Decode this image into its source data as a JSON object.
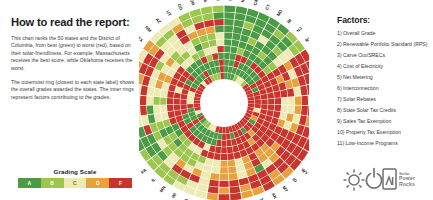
{
  "howto": {
    "title": "How to read the report:",
    "paragraphs": [
      "This chart ranks the 50 states and the District of Columbia, from best (green) to worst (red), based on their solar-friendliness. For example, Massachusetts receives the best score, while Oklahoma receives the worst.",
      "The outermost ring (closest to each state label) shows the overall grades awarded the states. The inner rings represent factors contributing to the grades."
    ]
  },
  "grading_scale": {
    "title": "Grading Scale",
    "grades": [
      {
        "label": "A",
        "color": "#4a9b43"
      },
      {
        "label": "B",
        "color": "#9cc64c"
      },
      {
        "label": "C",
        "color": "#eeeab3"
      },
      {
        "label": "D",
        "color": "#e8a13c"
      },
      {
        "label": "F",
        "color": "#c9352c"
      }
    ]
  },
  "factors": {
    "title": "Factors:",
    "items": [
      "1) Overall Grade",
      "2) Renewable Portfolio Standard (RPS)",
      "3) Carve Out/SRECs",
      "4) Cost of Electricity",
      "5) Net Metering",
      "6) Interconnection",
      "7) Solar Rebates",
      "8) State Solar Tax Credits",
      "9) Sales Tax Exemption",
      "10) Property Tax Exemption",
      "11) Low-Income Programs"
    ]
  },
  "logo": {
    "icons": [
      "sun-icon",
      "power-icon",
      "rock-icon"
    ],
    "word_1": "Solar",
    "word_2": "Power",
    "word_3": "Rocks",
    "color": "#7d7d7d"
  },
  "chart_data": {
    "type": "heatmap",
    "layout": "radial",
    "grid": false,
    "legend": "grading-scale",
    "ring_count": 11,
    "ring_labels": [
      "Overall Grade",
      "Renewable Portfolio Standard (RPS)",
      "Carve Out/SRECs",
      "Cost of Electricity",
      "Net Metering",
      "Interconnection",
      "Solar Rebates",
      "State Solar Tax Credits",
      "Sales Tax Exemption",
      "Property Tax Exemption",
      "Low-Income Programs"
    ],
    "grade_colors": {
      "A": "#4a9b43",
      "B": "#9cc64c",
      "C": "#eeeab3",
      "D": "#e8a13c",
      "F": "#c9352c"
    },
    "categories": [
      "MA",
      "NY",
      "CA",
      "CT",
      "MD",
      "RI",
      "NJ",
      "NV",
      "OK",
      "LA",
      "AL",
      "MS",
      "MO",
      "TN",
      "MI",
      "KY",
      "ND",
      "SD",
      "WY",
      "ID",
      "MT",
      "AK",
      "NE",
      "KS",
      "AR",
      "WV",
      "IN",
      "OH",
      "IA",
      "WI",
      "MN",
      "IL",
      "PA",
      "DE",
      "DC",
      "VT",
      "NH",
      "ME",
      "VA",
      "NC",
      "SC",
      "GA",
      "FL",
      "TX",
      "NM",
      "AZ",
      "UT",
      "CO",
      "OR",
      "WA",
      "HI"
    ],
    "series": [
      {
        "name": "Overall Grade",
        "values": [
          "A",
          "A",
          "A",
          "A",
          "A",
          "A",
          "B",
          "B",
          "F",
          "F",
          "F",
          "F",
          "D",
          "D",
          "D",
          "D",
          "F",
          "F",
          "F",
          "D",
          "D",
          "F",
          "D",
          "D",
          "F",
          "F",
          "D",
          "C",
          "C",
          "C",
          "B",
          "B",
          "B",
          "B",
          "A",
          "B",
          "C",
          "C",
          "C",
          "C",
          "D",
          "D",
          "C",
          "D",
          "C",
          "C",
          "C",
          "B",
          "B",
          "B",
          "B"
        ]
      },
      {
        "name": "Renewable Portfolio Standard (RPS)",
        "values": [
          "A",
          "A",
          "A",
          "A",
          "A",
          "B",
          "A",
          "B",
          "F",
          "F",
          "F",
          "F",
          "C",
          "F",
          "D",
          "F",
          "F",
          "F",
          "F",
          "F",
          "D",
          "F",
          "F",
          "D",
          "F",
          "D",
          "F",
          "C",
          "C",
          "B",
          "B",
          "B",
          "B",
          "A",
          "A",
          "A",
          "C",
          "C",
          "C",
          "C",
          "D",
          "F",
          "F",
          "D",
          "B",
          "B",
          "D",
          "B",
          "B",
          "B",
          "A"
        ]
      },
      {
        "name": "Carve Out/SRECs",
        "values": [
          "A",
          "A",
          "B",
          "A",
          "A",
          "A",
          "A",
          "C",
          "F",
          "F",
          "F",
          "F",
          "F",
          "F",
          "F",
          "F",
          "F",
          "F",
          "F",
          "F",
          "F",
          "F",
          "F",
          "F",
          "F",
          "F",
          "F",
          "C",
          "F",
          "F",
          "F",
          "C",
          "A",
          "A",
          "A",
          "F",
          "C",
          "F",
          "F",
          "F",
          "F",
          "F",
          "F",
          "F",
          "C",
          "C",
          "F",
          "C",
          "F",
          "F",
          "F"
        ]
      },
      {
        "name": "Cost of Electricity",
        "values": [
          "A",
          "A",
          "A",
          "A",
          "C",
          "A",
          "B",
          "C",
          "D",
          "C",
          "D",
          "C",
          "D",
          "D",
          "C",
          "D",
          "F",
          "F",
          "F",
          "D",
          "C",
          "A",
          "D",
          "C",
          "D",
          "D",
          "D",
          "C",
          "D",
          "C",
          "D",
          "C",
          "B",
          "C",
          "B",
          "B",
          "A",
          "A",
          "C",
          "C",
          "C",
          "C",
          "B",
          "C",
          "C",
          "C",
          "F",
          "D",
          "D",
          "D",
          "A"
        ]
      },
      {
        "name": "Net Metering",
        "values": [
          "A",
          "A",
          "A",
          "B",
          "A",
          "A",
          "A",
          "C",
          "F",
          "F",
          "D",
          "F",
          "C",
          "C",
          "D",
          "C",
          "F",
          "F",
          "D",
          "D",
          "D",
          "F",
          "D",
          "C",
          "D",
          "D",
          "C",
          "C",
          "C",
          "B",
          "B",
          "B",
          "B",
          "B",
          "A",
          "B",
          "C",
          "C",
          "B",
          "C",
          "D",
          "D",
          "C",
          "D",
          "B",
          "C",
          "C",
          "B",
          "B",
          "B",
          "C"
        ]
      },
      {
        "name": "Interconnection",
        "values": [
          "A",
          "A",
          "A",
          "A",
          "A",
          "B",
          "A",
          "B",
          "F",
          "D",
          "F",
          "F",
          "C",
          "C",
          "C",
          "D",
          "F",
          "F",
          "F",
          "D",
          "D",
          "F",
          "D",
          "C",
          "D",
          "D",
          "C",
          "C",
          "B",
          "B",
          "B",
          "B",
          "A",
          "B",
          "A",
          "B",
          "C",
          "C",
          "B",
          "C",
          "C",
          "D",
          "C",
          "C",
          "B",
          "B",
          "C",
          "A",
          "B",
          "B",
          "C"
        ]
      },
      {
        "name": "Solar Rebates",
        "values": [
          "A",
          "A",
          "B",
          "A",
          "A",
          "A",
          "A",
          "B",
          "F",
          "F",
          "F",
          "F",
          "F",
          "F",
          "F",
          "F",
          "F",
          "F",
          "F",
          "F",
          "F",
          "F",
          "F",
          "F",
          "F",
          "F",
          "F",
          "F",
          "F",
          "C",
          "C",
          "B",
          "B",
          "A",
          "A",
          "F",
          "F",
          "F",
          "F",
          "F",
          "F",
          "F",
          "F",
          "F",
          "C",
          "C",
          "B",
          "B",
          "C",
          "C",
          "F"
        ]
      },
      {
        "name": "State Solar Tax Credits",
        "values": [
          "A",
          "A",
          "F",
          "F",
          "A",
          "F",
          "F",
          "F",
          "F",
          "F",
          "F",
          "F",
          "F",
          "F",
          "F",
          "F",
          "F",
          "F",
          "F",
          "F",
          "D",
          "F",
          "F",
          "F",
          "F",
          "F",
          "F",
          "F",
          "C",
          "F",
          "F",
          "F",
          "F",
          "F",
          "F",
          "F",
          "F",
          "F",
          "F",
          "F",
          "C",
          "F",
          "F",
          "F",
          "A",
          "A",
          "A",
          "F",
          "B",
          "F",
          "A"
        ]
      },
      {
        "name": "Sales Tax Exemption",
        "values": [
          "A",
          "A",
          "F",
          "A",
          "A",
          "A",
          "A",
          "A",
          "F",
          "F",
          "F",
          "F",
          "F",
          "F",
          "F",
          "F",
          "F",
          "F",
          "F",
          "D",
          "F",
          "F",
          "F",
          "F",
          "F",
          "F",
          "F",
          "A",
          "A",
          "A",
          "A",
          "A",
          "A",
          "F",
          "A",
          "A",
          "F",
          "F",
          "F",
          "F",
          "F",
          "F",
          "A",
          "F",
          "A",
          "A",
          "A",
          "A",
          "A",
          "A",
          "F"
        ]
      },
      {
        "name": "Property Tax Exemption",
        "values": [
          "A",
          "A",
          "A",
          "A",
          "A",
          "A",
          "A",
          "A",
          "F",
          "A",
          "F",
          "F",
          "F",
          "F",
          "C",
          "F",
          "D",
          "A",
          "F",
          "F",
          "A",
          "F",
          "F",
          "A",
          "F",
          "F",
          "A",
          "A",
          "A",
          "A",
          "A",
          "A",
          "A",
          "F",
          "A",
          "A",
          "A",
          "F",
          "C",
          "C",
          "C",
          "F",
          "A",
          "A",
          "A",
          "A",
          "F",
          "A",
          "A",
          "A",
          "F"
        ]
      },
      {
        "name": "Low-Income Programs",
        "values": [
          "A",
          "A",
          "A",
          "B",
          "C",
          "C",
          "B",
          "F",
          "F",
          "F",
          "F",
          "F",
          "F",
          "F",
          "F",
          "F",
          "F",
          "F",
          "F",
          "F",
          "F",
          "F",
          "F",
          "F",
          "F",
          "F",
          "F",
          "F",
          "C",
          "C",
          "B",
          "B",
          "A",
          "F",
          "A",
          "C",
          "F",
          "F",
          "F",
          "F",
          "F",
          "F",
          "F",
          "F",
          "C",
          "F",
          "F",
          "B",
          "B",
          "B",
          "F"
        ]
      }
    ]
  }
}
